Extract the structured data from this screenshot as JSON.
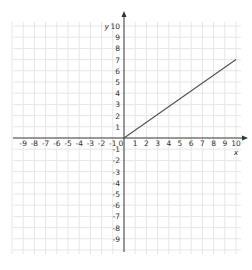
{
  "chart_data": {
    "type": "line",
    "title": "",
    "xlabel": "x",
    "ylabel": "y",
    "xlim": [
      -10,
      10
    ],
    "ylim": [
      -10,
      10
    ],
    "grid": true,
    "x_ticks": [
      -9,
      -8,
      -7,
      -6,
      -5,
      -4,
      -3,
      -2,
      -1,
      0,
      1,
      2,
      3,
      4,
      5,
      6,
      7,
      8,
      9,
      10
    ],
    "y_ticks": [
      10,
      9,
      8,
      7,
      6,
      5,
      4,
      3,
      2,
      1,
      -1,
      -2,
      -3,
      -4,
      -5,
      -6,
      -7,
      -8,
      -9
    ],
    "series": [
      {
        "name": "line",
        "x": [
          0,
          10
        ],
        "y": [
          0,
          7
        ]
      }
    ]
  },
  "colors": {
    "grid": "#e6e6e6",
    "axis": "#333333",
    "line": "#555555"
  },
  "layout": {
    "origin_x": 124,
    "origin_y": 138,
    "unit": 11.2,
    "x_axis_left": 13,
    "x_axis_right": 245,
    "y_axis_top": 14,
    "y_axis_bottom": 252
  }
}
